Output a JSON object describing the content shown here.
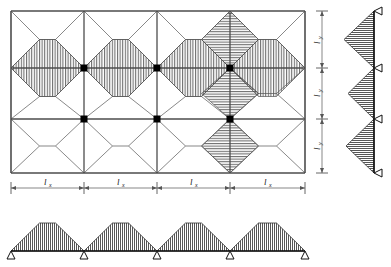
{
  "figure": {
    "type": "structural-engineering-diagram"
  },
  "colors": {
    "outline": "#4d4d4d",
    "gridline": "#4d4d4d",
    "diagonal": "#555555",
    "hatch": "#3a3a3a",
    "column": "#000000",
    "dimension": "#555555",
    "background": "#ffffff"
  },
  "plan": {
    "name": "slab-panel-plan",
    "bays_x": 4,
    "bays_y": 3,
    "x_gridlines": [
      11,
      84,
      157,
      230,
      305
    ],
    "y_gridlines": [
      11,
      68,
      119,
      173
    ],
    "column_markers": [
      {
        "x": 84,
        "y": 68
      },
      {
        "x": 157,
        "y": 68
      },
      {
        "x": 230,
        "y": 68
      },
      {
        "x": 84,
        "y": 119
      },
      {
        "x": 157,
        "y": 119
      },
      {
        "x": 230,
        "y": 119
      }
    ],
    "column_size": 7
  },
  "hatch_regions": {
    "vertical_hatch_note": "vertical line hatching marks load carried by the x-direction (horizontal) beams",
    "horizontal_hatch_note": "horizontal line hatching marks load carried by the y-direction (vertical) beams"
  },
  "dimensions": {
    "horizontal": {
      "name": "span-dimension-x",
      "symbol": "l",
      "subscript": "x",
      "labels": [
        "l",
        "l",
        "l",
        "l"
      ],
      "subscripts": [
        "x",
        "x",
        "x",
        "x"
      ],
      "count": 4,
      "y": 188
    },
    "vertical": {
      "name": "span-dimension-y",
      "symbol": "l",
      "subscript": "y",
      "labels": [
        "l",
        "l",
        "l"
      ],
      "subscripts": [
        "y",
        "y",
        "y"
      ],
      "count": 3,
      "x": 322
    }
  },
  "right_elevation": {
    "name": "vertical-beam-load-diagram",
    "axis_x": 374,
    "supports": [
      {
        "y": 11,
        "type": "pin"
      },
      {
        "y": 68,
        "type": "pin"
      },
      {
        "y": 119,
        "type": "pin"
      },
      {
        "y": 173,
        "type": "pin"
      }
    ],
    "loads": [
      {
        "from": 11,
        "to": 68,
        "shape": "triangular",
        "peak_offset": 30,
        "hatch": "horizontal"
      },
      {
        "from": 68,
        "to": 119,
        "shape": "triangular",
        "peak_offset": 26,
        "hatch": "horizontal"
      },
      {
        "from": 119,
        "to": 173,
        "shape": "triangular",
        "peak_offset": 28,
        "hatch": "horizontal"
      }
    ]
  },
  "bottom_elevation": {
    "name": "horizontal-beam-load-diagram",
    "axis_y": 251,
    "supports": [
      {
        "x": 11,
        "type": "pin"
      },
      {
        "x": 84,
        "type": "pin"
      },
      {
        "x": 157,
        "type": "pin"
      },
      {
        "x": 230,
        "type": "pin"
      },
      {
        "x": 305,
        "type": "pin"
      }
    ],
    "loads": [
      {
        "from": 11,
        "to": 84,
        "shape": "trapezoidal",
        "peak_height": 28,
        "hatch": "vertical"
      },
      {
        "from": 84,
        "to": 157,
        "shape": "trapezoidal",
        "peak_height": 28,
        "hatch": "vertical"
      },
      {
        "from": 157,
        "to": 230,
        "shape": "trapezoidal",
        "peak_height": 28,
        "hatch": "vertical"
      },
      {
        "from": 230,
        "to": 305,
        "shape": "trapezoidal",
        "peak_height": 28,
        "hatch": "vertical"
      }
    ]
  }
}
